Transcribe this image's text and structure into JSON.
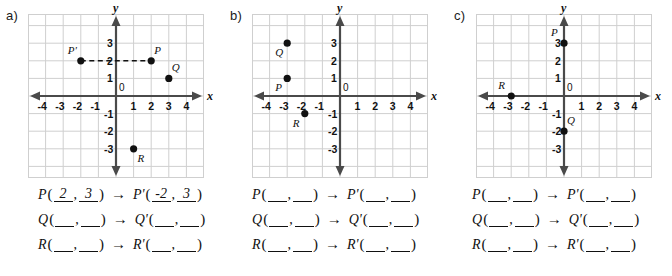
{
  "worksheet": {
    "title": "Coordinate translation worksheet",
    "axis_x_name": "x",
    "axis_y_name": "y",
    "origin_label": "0",
    "arrow_glyph": "→",
    "blank_placeholder": "",
    "tick_labels_x": [
      "-4",
      "-3",
      "-2",
      "-1",
      "1",
      "2",
      "3",
      "4"
    ],
    "tick_labels_y": [
      "3",
      "2",
      "1",
      "-1",
      "-2",
      "-3"
    ]
  },
  "panels": [
    {
      "id": "a",
      "label": "a)",
      "points": [
        {
          "name": "P'",
          "x": -2,
          "y": 2,
          "label_pos": "above-left"
        },
        {
          "name": "P",
          "x": 2,
          "y": 2,
          "label_pos": "above-right"
        },
        {
          "name": "Q",
          "x": 3,
          "y": 1,
          "label_pos": "above-right"
        },
        {
          "name": "R",
          "x": 1,
          "y": -3,
          "label_pos": "below-right"
        }
      ],
      "dashed_connector": {
        "from": [
          -2,
          2
        ],
        "to": [
          2,
          2
        ]
      },
      "answer_rows": [
        {
          "name": "P",
          "prime": "P'",
          "x": "2",
          "y": "3",
          "px": "-2",
          "py": "3"
        },
        {
          "name": "Q",
          "prime": "Q'",
          "x": "",
          "y": "",
          "px": "",
          "py": ""
        },
        {
          "name": "R",
          "prime": "R'",
          "x": "",
          "y": "",
          "px": "",
          "py": ""
        }
      ]
    },
    {
      "id": "b",
      "label": "b)",
      "points": [
        {
          "name": "Q",
          "x": -3,
          "y": 3,
          "label_pos": "below-left"
        },
        {
          "name": "P",
          "x": -3,
          "y": 1,
          "label_pos": "below-left"
        },
        {
          "name": "R",
          "x": -2,
          "y": -1,
          "label_pos": "below-left"
        }
      ],
      "dashed_connector": null,
      "answer_rows": [
        {
          "name": "P",
          "prime": "P'",
          "x": "",
          "y": "",
          "px": "",
          "py": ""
        },
        {
          "name": "Q",
          "prime": "Q'",
          "x": "",
          "y": "",
          "px": "",
          "py": ""
        },
        {
          "name": "R",
          "prime": "R'",
          "x": "",
          "y": "",
          "px": "",
          "py": ""
        }
      ]
    },
    {
      "id": "c",
      "label": "c)",
      "points": [
        {
          "name": "P",
          "x": 0,
          "y": 3,
          "label_pos": "above-left"
        },
        {
          "name": "Q",
          "x": 0,
          "y": -2,
          "label_pos": "above-right"
        },
        {
          "name": "R",
          "x": -3,
          "y": 0,
          "label_pos": "above-left"
        }
      ],
      "dashed_connector": null,
      "answer_rows": [
        {
          "name": "P",
          "prime": "P'",
          "x": "",
          "y": "",
          "px": "",
          "py": ""
        },
        {
          "name": "Q",
          "prime": "Q'",
          "x": "",
          "y": "",
          "px": "",
          "py": ""
        },
        {
          "name": "R",
          "prime": "R'",
          "x": "",
          "y": "",
          "px": "",
          "py": ""
        }
      ]
    }
  ],
  "colors": {
    "grid_line": "#cfcfcf",
    "axis": "#4a4a4a",
    "point": "#111111",
    "text": "#111111",
    "background": "#ffffff"
  }
}
